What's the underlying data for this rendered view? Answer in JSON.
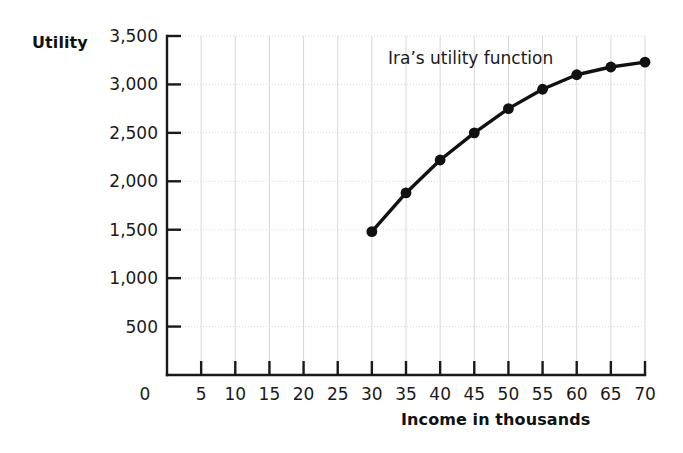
{
  "chart_data": {
    "type": "line",
    "title": "",
    "subtitle": "",
    "annotations": [
      {
        "name": "series-label",
        "text": "Ira’s utility function",
        "x": 50,
        "y": 3290
      }
    ],
    "xlabel": "Income in thousands",
    "ylabel": "Utility",
    "xlim": [
      0,
      70
    ],
    "ylim": [
      0,
      3500
    ],
    "xticks": [
      0,
      5,
      10,
      15,
      20,
      25,
      30,
      35,
      40,
      45,
      50,
      55,
      60,
      65,
      70
    ],
    "xticklabels": [
      "0",
      "5",
      "10",
      "15",
      "20",
      "25",
      "30",
      "35",
      "40",
      "45",
      "50",
      "55",
      "60",
      "65",
      "70"
    ],
    "yticks": [
      0,
      500,
      1000,
      1500,
      2000,
      2500,
      3000,
      3500
    ],
    "yticklabels": [
      "",
      "500",
      "1,000",
      "1,500",
      "2,000",
      "2,500",
      "3,000",
      "3,500"
    ],
    "grid": true,
    "grid_color": "#d8d8d8",
    "legend": false,
    "legend_position": "none",
    "marker": "circle",
    "marker_color": "#111111",
    "line_color": "#111111",
    "line_width": 3.4,
    "series": [
      {
        "name": "Ira's utility function",
        "x": [
          30,
          35,
          40,
          45,
          50,
          55,
          60,
          65,
          70
        ],
        "values": [
          1480,
          1880,
          2220,
          2500,
          2750,
          2950,
          3100,
          3180,
          3230
        ]
      }
    ]
  },
  "colors": {
    "background": "#ffffff",
    "axis": "#1a1a1a",
    "grid": "#d8d8d8",
    "text": "#1a1a1a",
    "data": "#111111"
  }
}
